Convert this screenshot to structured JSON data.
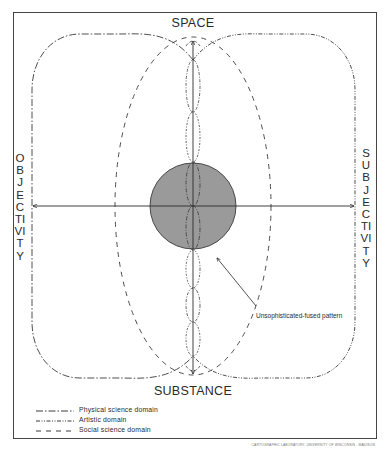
{
  "diagram": {
    "axes": {
      "top": "SPACE",
      "bottom": "SUBSTANCE",
      "left": "OBJECTIVITY",
      "right": "SUBJECTIVITY"
    },
    "annotation": "Unsophisticated-fused pattern",
    "legend": [
      {
        "style": "long-dash-dot",
        "label": "Physical science domain"
      },
      {
        "style": "dash-dot-dot",
        "label": "Artistic domain"
      },
      {
        "style": "dashed",
        "label": "Social science domain"
      }
    ],
    "credit": "CARTOGRAPHIC LABORATORY, UNIVERSITY OF WISCONSIN - MADISON",
    "colors": {
      "line": "#2a2a2a",
      "fused_fill": "#9a9a9a",
      "background": "#ffffff"
    }
  }
}
